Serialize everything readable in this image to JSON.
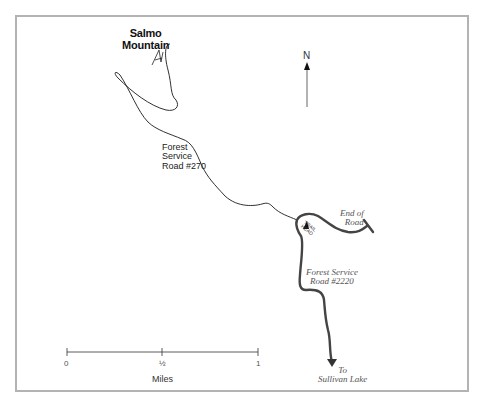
{
  "map": {
    "peak": {
      "name_line1": "Salmo",
      "name_line2": "Mountain",
      "icon": "mountain-peak-icon"
    },
    "roads": {
      "fs270": {
        "line1": "Forest",
        "line2": "Service",
        "line3": "Road #270"
      },
      "fs2220": {
        "line1": "Forest Service",
        "line2": "Road #2220"
      }
    },
    "end_of_road": {
      "line1": "End of",
      "line2": "Road"
    },
    "trailhead": {
      "label_line1": "TRAIL",
      "label_line2": "HEAD",
      "icon": "trailhead-marker-icon"
    },
    "destination": {
      "line1": "To",
      "line2": "Sullivan Lake"
    },
    "north_arrow": {
      "label": "N",
      "icon": "north-arrow-icon"
    },
    "scale": {
      "ticks": [
        "0",
        "½",
        "1"
      ],
      "unit": "Miles"
    },
    "colors": {
      "frame": "#b3b3b3",
      "thin_road": "#1a1a1a",
      "thick_road": "#444444",
      "north_arrow": "#555555"
    }
  }
}
